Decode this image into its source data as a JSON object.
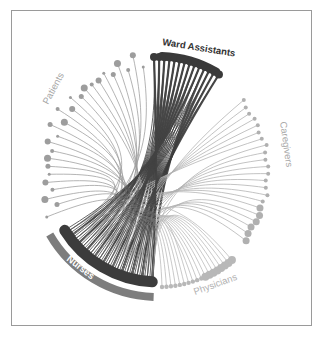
{
  "diagram": {
    "type": "hierarchical-edge-bundling",
    "hub_group": "Nurses",
    "groups": [
      {
        "name": "Ward Assistants",
        "color": "#3a3a3a",
        "label_color": "#333333",
        "node_count": 14,
        "emphasis": "dark"
      },
      {
        "name": "Caregivers",
        "color": "#b0b0b0",
        "label_color": "#a8a8a8",
        "node_count": 22,
        "emphasis": "light"
      },
      {
        "name": "Physicians",
        "color": "#b8b8b8",
        "label_color": "#b0b0b0",
        "node_count": 18,
        "emphasis": "light"
      },
      {
        "name": "Nurses",
        "color": "#3c3c3c",
        "label_color": "#ffffff",
        "node_count": 40,
        "emphasis": "dark",
        "band_color": "#7d7d7d"
      },
      {
        "name": "Patients",
        "color": "#9d9d9d",
        "label_color": "#a5a5a5",
        "node_count": 26,
        "emphasis": "medium"
      }
    ]
  }
}
